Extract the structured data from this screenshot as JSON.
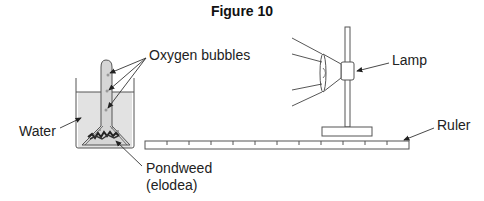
{
  "figure": {
    "title": "Figure 10"
  },
  "labels": {
    "oxygen_bubbles": "Oxygen bubbles",
    "lamp": "Lamp",
    "water": "Water",
    "ruler": "Ruler",
    "pondweed_line1": "Pondweed",
    "pondweed_line2": "(elodea)"
  },
  "ruler": {
    "tick_count": 12
  },
  "colors": {
    "line": "#555555",
    "water_fill": "#e2e2e2",
    "text": "#222222"
  }
}
